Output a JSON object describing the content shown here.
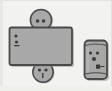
{
  "scene": {
    "title": "hand-drawn figure sketch",
    "width": 112,
    "height": 91,
    "background_color": "#f2f2f0",
    "border_color": "#dcdcd8",
    "ink_color": "#4a4a4a",
    "fill_color": "#a8a8a8",
    "shade_color": "#8f8f8f",
    "highlight_color": "#c2c2c2"
  },
  "figure": {
    "label": "robot-like figure",
    "body": {
      "label": "body-rectangle",
      "x": 9,
      "y": 27,
      "width": 63,
      "height": 38,
      "fill": "#a8a8a8",
      "stroke": "#4a4a4a",
      "marks": [
        {
          "label": "mark-upper-dot",
          "cx": 16,
          "cy": 36,
          "r": 1.6
        },
        {
          "label": "mark-lower-dot",
          "cx": 16.5,
          "cy": 42,
          "r": 1.6
        },
        {
          "label": "mark-tick",
          "x1": 14.5,
          "y1": 45.5,
          "x2": 19,
          "y2": 45.5
        }
      ]
    },
    "head": {
      "label": "head-circle",
      "cx": 41,
      "cy": 20,
      "r": 11,
      "fill": "#a8a8a8",
      "stroke": "#4a4a4a",
      "eyes": [
        {
          "label": "eye-left",
          "cx": 37.5,
          "cy": 21,
          "r": 1.7
        },
        {
          "label": "eye-right",
          "cx": 43.5,
          "cy": 21,
          "r": 1.7
        }
      ]
    },
    "foot": {
      "label": "foot-face-circle",
      "cx": 43,
      "cy": 72,
      "r": 10.5,
      "fill": "#a8a8a8",
      "stroke": "#4a4a4a",
      "eyes": [
        {
          "label": "eye-left",
          "cx": 39.5,
          "cy": 70,
          "r": 1.6
        },
        {
          "label": "eye-right",
          "cx": 46,
          "cy": 70,
          "r": 1.6
        }
      ],
      "mouth": {
        "label": "mouth-line",
        "x1": 42.8,
        "y1": 73.5,
        "x2": 42.8,
        "y2": 77.5
      }
    }
  },
  "companion": {
    "label": "cylinder-character",
    "x": 84,
    "y": 40,
    "width": 23,
    "height": 39,
    "corner_radius": 4,
    "fill": "#a8a8a8",
    "stroke": "#4a4a4a",
    "top_band_y": 45,
    "bottom_band_y": 74,
    "face": {
      "eyes": [
        {
          "label": "eye-left",
          "cx": 90.5,
          "cy": 53,
          "r": 1.6
        },
        {
          "label": "eye-right",
          "cx": 97.5,
          "cy": 53,
          "r": 1.6
        }
      ],
      "nose": {
        "label": "nose-mark",
        "cx": 94,
        "cy": 59,
        "r": 2.0
      },
      "badge": {
        "label": "badge-mark",
        "x": 96,
        "y": 65,
        "width": 4,
        "height": 4
      },
      "accent": {
        "label": "accent-tick",
        "x1": 101,
        "y1": 66,
        "x2": 104,
        "y2": 66
      }
    }
  }
}
